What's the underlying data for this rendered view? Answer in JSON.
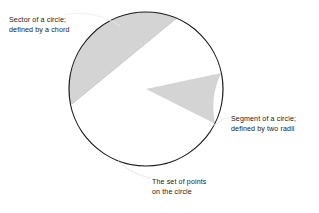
{
  "diagram": {
    "background_color": "#ffffff",
    "stroke_color": "#1a1a1a",
    "shade_color": "#d4d4d4",
    "text_color": "#1a1a1a",
    "circle": {
      "center_x": 146,
      "center_y": 89,
      "radius": 77,
      "stroke_width": 1.2
    },
    "sector": {
      "name": "sector-region",
      "shaded": true,
      "chord_start_x": 178,
      "chord_start_y": 17,
      "chord_end_x": 72,
      "chord_end_y": 104
    },
    "segment": {
      "name": "segment-region",
      "shaded": true,
      "radius_a_angle_deg": -12,
      "radius_b_angle_deg": 26
    }
  },
  "labels": {
    "sector": {
      "line1": "Sector of a circle;",
      "line2": "defined by a chord"
    },
    "segment": {
      "line1": "Segment of a circle;",
      "line2": "defined by two radii"
    },
    "points": {
      "line1": "The set of points",
      "line2": "on the circle"
    }
  }
}
